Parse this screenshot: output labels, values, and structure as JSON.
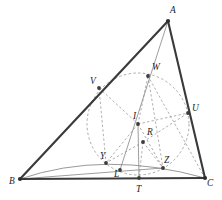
{
  "figure": {
    "width": 222,
    "height": 200,
    "colors": {
      "side_stroke": "#3a3a3a",
      "thin_stroke": "#8d8d8d",
      "dashed_stroke": "#9a9a9a",
      "circle_stroke": "#a0a0a0",
      "point_fill": "#3c3c3c",
      "label_fill": "#1d1d1d",
      "background": "#ffffff"
    }
  },
  "points": {
    "A": {
      "label": "A",
      "x": 168,
      "y": 21,
      "lx": 170,
      "ly": 13,
      "kind": "vertex"
    },
    "B": {
      "label": "B",
      "x": 20,
      "y": 179,
      "lx": 9,
      "ly": 184,
      "kind": "vertex"
    },
    "C": {
      "label": "C",
      "x": 205,
      "y": 178,
      "lx": 207,
      "ly": 186,
      "kind": "vertex"
    },
    "V": {
      "label": "V",
      "x": 99,
      "y": 88,
      "lx": 90,
      "ly": 84,
      "kind": "touch"
    },
    "W": {
      "label": "W",
      "x": 148,
      "y": 76,
      "lx": 152,
      "ly": 70,
      "kind": "touch"
    },
    "U": {
      "label": "U",
      "x": 188,
      "y": 113,
      "lx": 192,
      "ly": 111,
      "kind": "touch"
    },
    "I": {
      "label": "I",
      "x": 138,
      "y": 124,
      "lx": 133,
      "ly": 119,
      "kind": "center"
    },
    "R": {
      "label": "R",
      "x": 143,
      "y": 142,
      "lx": 147,
      "ly": 135,
      "kind": "center"
    },
    "Y": {
      "label": "Y",
      "x": 106,
      "y": 163,
      "lx": 100,
      "ly": 159,
      "kind": "touch"
    },
    "L": {
      "label": "L",
      "x": 120,
      "y": 170,
      "lx": 114,
      "ly": 177,
      "kind": "touch"
    },
    "Z": {
      "label": "Z",
      "x": 163,
      "y": 168,
      "lx": 164,
      "ly": 163,
      "kind": "touch"
    },
    "T": {
      "label": "T",
      "x": 139,
      "y": 178,
      "lx": 136,
      "ly": 192,
      "kind": "touch"
    }
  },
  "incircle": {
    "cx": 138,
    "cy": 124,
    "r": 51,
    "style": "dashed"
  },
  "arc_bytc": {
    "description": "thin arc through B, Y, L, Z, C",
    "path": "M 20,179 Q 105,150 205,178"
  },
  "segments": {
    "sides": [
      {
        "name": "AB",
        "from": "A",
        "to": "B"
      },
      {
        "name": "BC",
        "from": "B",
        "to": "C"
      },
      {
        "name": "CA",
        "from": "C",
        "to": "A"
      }
    ],
    "thin": [
      {
        "name": "A-W-L",
        "from": "A",
        "to": "L"
      },
      {
        "name": "B-Z",
        "from": "B",
        "to": "Z"
      },
      {
        "name": "I-T",
        "from": "I",
        "to": "T"
      }
    ],
    "dashed": [
      {
        "name": "I-V",
        "from": "I",
        "to": "V"
      },
      {
        "name": "I-W",
        "from": "I",
        "to": "W"
      },
      {
        "name": "I-U",
        "from": "I",
        "to": "U"
      },
      {
        "name": "I-Y",
        "from": "I",
        "to": "Y"
      },
      {
        "name": "I-Z",
        "from": "I",
        "to": "Z"
      },
      {
        "name": "R-Y",
        "from": "R",
        "to": "Y"
      },
      {
        "name": "R-Z",
        "from": "R",
        "to": "Z"
      },
      {
        "name": "R-U",
        "from": "R",
        "to": "U"
      },
      {
        "name": "R-T",
        "from": "R",
        "to": "T"
      },
      {
        "name": "V-Y",
        "from": "V",
        "to": "Y"
      },
      {
        "name": "W-Z",
        "from": "W",
        "to": "Z"
      },
      {
        "name": "C-W",
        "from": "C",
        "to": "W"
      }
    ]
  }
}
